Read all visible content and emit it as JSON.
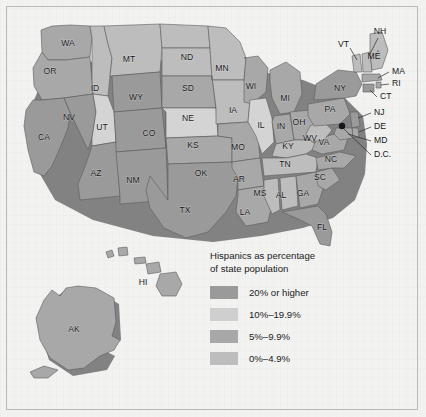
{
  "figure": {
    "title": "Hispanics as percentage of state population",
    "background_color": "#f2f2f0",
    "frame_color": "#b9b9b5"
  },
  "legend": {
    "title_line1": "Hispanics as percentage",
    "title_line2": "of state population",
    "title": "Hispanics as percentage\nof state population",
    "entries": [
      {
        "label": "20% or higher",
        "color": "#9a9a9a",
        "bin": 3
      },
      {
        "label": "10%–19.9%",
        "color": "#cfcfcf",
        "bin": 2
      },
      {
        "label": "5%–9.9%",
        "color": "#a8a8a8",
        "bin": 1
      },
      {
        "label": "0%–4.9%",
        "color": "#bdbdbd",
        "bin": 0
      }
    ]
  },
  "chart_data": {
    "type": "map",
    "title": "Hispanics as percentage of state population",
    "legend_position": "inset-bottom-right",
    "classes": [
      "0%–4.9%",
      "5%–9.9%",
      "10%–19.9%",
      "20% or higher"
    ],
    "class_colors": [
      "#bdbdbd",
      "#a8a8a8",
      "#cfcfcf",
      "#9a9a9a"
    ],
    "categories": [
      "WA",
      "OR",
      "CA",
      "NV",
      "ID",
      "MT",
      "WY",
      "UT",
      "AZ",
      "CO",
      "NM",
      "ND",
      "SD",
      "NE",
      "KS",
      "OK",
      "TX",
      "MN",
      "IA",
      "MO",
      "AR",
      "LA",
      "WI",
      "IL",
      "MI",
      "IN",
      "OH",
      "KY",
      "TN",
      "MS",
      "AL",
      "GA",
      "FL",
      "SC",
      "NC",
      "VA",
      "WV",
      "PA",
      "NY",
      "VT",
      "NH",
      "ME",
      "MA",
      "RI",
      "CT",
      "NJ",
      "DE",
      "MD",
      "D.C.",
      "AK",
      "HI"
    ],
    "values": [
      1,
      1,
      3,
      3,
      0,
      0,
      3,
      1,
      3,
      3,
      3,
      0,
      0,
      1,
      1,
      1,
      3,
      0,
      0,
      1,
      1,
      1,
      1,
      1,
      1,
      1,
      1,
      0,
      0,
      0,
      0,
      1,
      3,
      1,
      1,
      1,
      0,
      1,
      3,
      0,
      0,
      0,
      1,
      1,
      3,
      3,
      1,
      1,
      3,
      1,
      1
    ],
    "state_class_labels": {
      "WA": "5%–9.9%",
      "OR": "5%–9.9%",
      "CA": "20% or higher",
      "NV": "20% or higher",
      "ID": "0%–4.9%",
      "MT": "0%–4.9%",
      "WY": "20% or higher",
      "UT": "5%–9.9%",
      "AZ": "20% or higher",
      "CO": "20% or higher",
      "NM": "20% or higher",
      "ND": "0%–4.9%",
      "SD": "0%–4.9%",
      "NE": "5%–9.9%",
      "KS": "5%–9.9%",
      "OK": "5%–9.9%",
      "TX": "20% or higher",
      "MN": "0%–4.9%",
      "IA": "0%–4.9%",
      "MO": "5%–9.9%",
      "AR": "5%–9.9%",
      "LA": "5%–9.9%",
      "WI": "5%–9.9%",
      "IL": "5%–9.9%",
      "MI": "5%–9.9%",
      "IN": "5%–9.9%",
      "OH": "5%–9.9%",
      "KY": "0%–4.9%",
      "TN": "0%–4.9%",
      "MS": "0%–4.9%",
      "AL": "0%–4.9%",
      "GA": "5%–9.9%",
      "FL": "20% or higher",
      "SC": "5%–9.9%",
      "NC": "5%–9.9%",
      "VA": "5%–9.9%",
      "WV": "0%–4.9%",
      "PA": "5%–9.9%",
      "NY": "20% or higher",
      "VT": "0%–4.9%",
      "NH": "0%–4.9%",
      "ME": "0%–4.9%",
      "MA": "5%–9.9%",
      "RI": "5%–9.9%",
      "CT": "20% or higher",
      "NJ": "20% or higher",
      "DE": "5%–9.9%",
      "MD": "5%–9.9%",
      "D.C.": "20% or higher",
      "AK": "5%–9.9%",
      "HI": "5%–9.9%"
    }
  },
  "map": {
    "inset_labels": [
      {
        "id": "AK",
        "label": "AK"
      },
      {
        "id": "HI",
        "label": "HI"
      }
    ],
    "states": [
      {
        "id": "WA",
        "label": "WA",
        "lx": 68,
        "ly": 44
      },
      {
        "id": "OR",
        "label": "OR",
        "lx": 50,
        "ly": 72
      },
      {
        "id": "CA",
        "label": "CA",
        "lx": 44,
        "ly": 138
      },
      {
        "id": "NV",
        "label": "NV",
        "lx": 69,
        "ly": 118
      },
      {
        "id": "ID",
        "label": "ID",
        "lx": 95,
        "ly": 89
      },
      {
        "id": "MT",
        "label": "MT",
        "lx": 129,
        "ly": 60
      },
      {
        "id": "WY",
        "label": "WY",
        "lx": 136,
        "ly": 98
      },
      {
        "id": "UT",
        "label": "UT",
        "lx": 102,
        "ly": 128
      },
      {
        "id": "AZ",
        "label": "AZ",
        "lx": 96,
        "ly": 174
      },
      {
        "id": "CO",
        "label": "CO",
        "lx": 149,
        "ly": 134
      },
      {
        "id": "NM",
        "label": "NM",
        "lx": 133,
        "ly": 181
      },
      {
        "id": "ND",
        "label": "ND",
        "lx": 187,
        "ly": 58
      },
      {
        "id": "SD",
        "label": "SD",
        "lx": 188,
        "ly": 89
      },
      {
        "id": "NE",
        "label": "NE",
        "lx": 188,
        "ly": 119
      },
      {
        "id": "KS",
        "label": "KS",
        "lx": 193,
        "ly": 146
      },
      {
        "id": "OK",
        "label": "OK",
        "lx": 201,
        "ly": 174
      },
      {
        "id": "TX",
        "label": "TX",
        "lx": 185,
        "ly": 211
      },
      {
        "id": "MN",
        "label": "MN",
        "lx": 222,
        "ly": 69
      },
      {
        "id": "IA",
        "label": "IA",
        "lx": 233,
        "ly": 111
      },
      {
        "id": "MO",
        "label": "MO",
        "lx": 238,
        "ly": 148
      },
      {
        "id": "AR",
        "label": "AR",
        "lx": 239,
        "ly": 180
      },
      {
        "id": "LA",
        "label": "LA",
        "lx": 245,
        "ly": 213
      },
      {
        "id": "WI",
        "label": "WI",
        "lx": 251,
        "ly": 87
      },
      {
        "id": "IL",
        "label": "IL",
        "lx": 261,
        "ly": 126
      },
      {
        "id": "MI",
        "label": "MI",
        "lx": 285,
        "ly": 99
      },
      {
        "id": "IN",
        "label": "IN",
        "lx": 281,
        "ly": 127
      },
      {
        "id": "OH",
        "label": "OH",
        "lx": 299,
        "ly": 123
      },
      {
        "id": "KY",
        "label": "KY",
        "lx": 288,
        "ly": 147
      },
      {
        "id": "TN",
        "label": "TN",
        "lx": 285,
        "ly": 165
      },
      {
        "id": "MS",
        "label": "MS",
        "lx": 260,
        "ly": 194
      },
      {
        "id": "AL",
        "label": "AL",
        "lx": 281,
        "ly": 196
      },
      {
        "id": "GA",
        "label": "GA",
        "lx": 303,
        "ly": 194
      },
      {
        "id": "FL",
        "label": "FL",
        "lx": 322,
        "ly": 228
      },
      {
        "id": "SC",
        "label": "SC",
        "lx": 320,
        "ly": 178
      },
      {
        "id": "NC",
        "label": "NC",
        "lx": 331,
        "ly": 160
      },
      {
        "id": "VA",
        "label": "VA",
        "lx": 324,
        "ly": 143
      },
      {
        "id": "WV",
        "label": "WV",
        "lx": 310,
        "ly": 139
      },
      {
        "id": "PA",
        "label": "PA",
        "lx": 330,
        "ly": 110
      },
      {
        "id": "NY",
        "label": "NY",
        "lx": 340,
        "ly": 89
      }
    ],
    "callouts": [
      {
        "id": "NH",
        "label": "NH",
        "tx": 380,
        "ty": 32,
        "anchor": "middle"
      },
      {
        "id": "VT",
        "label": "VT",
        "tx": 338,
        "ty": 45,
        "anchor": "start"
      },
      {
        "id": "ME",
        "label": "ME",
        "tx": 374,
        "ty": 57,
        "anchor": "middle"
      },
      {
        "id": "MA",
        "label": "MA",
        "tx": 392,
        "ty": 72,
        "anchor": "start"
      },
      {
        "id": "RI",
        "label": "RI",
        "tx": 392,
        "ty": 84,
        "anchor": "start"
      },
      {
        "id": "CT",
        "label": "CT",
        "tx": 380,
        "ty": 97,
        "anchor": "start"
      },
      {
        "id": "NJ",
        "label": "NJ",
        "tx": 374,
        "ty": 113,
        "anchor": "start"
      },
      {
        "id": "DE",
        "label": "DE",
        "tx": 374,
        "ty": 127,
        "anchor": "start"
      },
      {
        "id": "MD",
        "label": "MD",
        "tx": 374,
        "ty": 141,
        "anchor": "start"
      },
      {
        "id": "D.C.",
        "label": "D.C.",
        "tx": 374,
        "ty": 155,
        "anchor": "start"
      }
    ]
  }
}
